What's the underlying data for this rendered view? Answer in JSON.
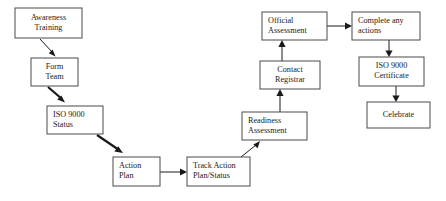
{
  "diagram": {
    "background_color": "#ffffff",
    "box_border_color": "#4a4a4a",
    "text_color": "#1a1a1a",
    "arrow_color": "#1a1a1a",
    "nodes": [
      {
        "id": "awareness-training",
        "lines": [
          "Awareness",
          "Training"
        ],
        "align": "center",
        "x": 15,
        "y": 8,
        "w": 67,
        "h": 30
      },
      {
        "id": "form-team",
        "lines": [
          "Form",
          "Team"
        ],
        "align": "center",
        "x": 31,
        "y": 58,
        "w": 47,
        "h": 28
      },
      {
        "id": "iso-9000-status",
        "lines": [
          "ISO 9000",
          "Status"
        ],
        "align": "left",
        "x": 47,
        "y": 106,
        "w": 56,
        "h": 28
      },
      {
        "id": "action-plan",
        "lines": [
          "Action",
          "Plan"
        ],
        "align": "left",
        "x": 113,
        "y": 157,
        "w": 47,
        "h": 29
      },
      {
        "id": "track-action-plan-status",
        "lines": [
          "Track Action",
          "Plan/Status"
        ],
        "align": "left",
        "x": 187,
        "y": 157,
        "w": 63,
        "h": 29
      },
      {
        "id": "readiness-assessment",
        "lines": [
          "Readiness",
          "Assessment"
        ],
        "align": "left",
        "x": 242,
        "y": 112,
        "w": 65,
        "h": 28
      },
      {
        "id": "contact-registrar",
        "lines": [
          "Contact",
          "Registrar"
        ],
        "align": "center",
        "x": 260,
        "y": 61,
        "w": 60,
        "h": 28
      },
      {
        "id": "official-assessment",
        "lines": [
          "Official",
          "Assessment"
        ],
        "align": "left",
        "x": 262,
        "y": 12,
        "w": 65,
        "h": 28
      },
      {
        "id": "complete-any-actions",
        "lines": [
          "Complete any",
          "actions"
        ],
        "align": "left",
        "x": 352,
        "y": 12,
        "w": 68,
        "h": 28
      },
      {
        "id": "iso-9000-certificate",
        "lines": [
          "ISO 9000",
          "Certificate"
        ],
        "align": "center",
        "x": 359,
        "y": 57,
        "w": 65,
        "h": 29
      },
      {
        "id": "celebrate",
        "lines": [
          "Celebrate"
        ],
        "align": "center",
        "x": 367,
        "y": 102,
        "w": 63,
        "h": 26
      }
    ],
    "edges": [
      {
        "id": "awareness-to-form-team",
        "from": "awareness-training",
        "to": "form-team",
        "kind": "diagonal"
      },
      {
        "id": "form-team-to-iso-status",
        "from": "form-team",
        "to": "iso-9000-status",
        "kind": "diagonal"
      },
      {
        "id": "iso-status-to-action-plan",
        "from": "iso-9000-status",
        "to": "action-plan",
        "kind": "diagonal"
      },
      {
        "id": "action-plan-to-track-action",
        "from": "action-plan",
        "to": "track-action-plan-status",
        "kind": "horizontal"
      },
      {
        "id": "track-action-to-readiness",
        "from": "track-action-plan-status",
        "to": "readiness-assessment",
        "kind": "diagonal"
      },
      {
        "id": "readiness-to-contact",
        "from": "readiness-assessment",
        "to": "contact-registrar",
        "kind": "vertical"
      },
      {
        "id": "contact-to-official",
        "from": "contact-registrar",
        "to": "official-assessment",
        "kind": "vertical"
      },
      {
        "id": "official-to-complete",
        "from": "official-assessment",
        "to": "complete-any-actions",
        "kind": "horizontal"
      },
      {
        "id": "complete-to-certificate",
        "from": "complete-any-actions",
        "to": "iso-9000-certificate",
        "kind": "vertical"
      },
      {
        "id": "certificate-to-celebrate",
        "from": "iso-9000-certificate",
        "to": "celebrate",
        "kind": "vertical"
      }
    ]
  }
}
